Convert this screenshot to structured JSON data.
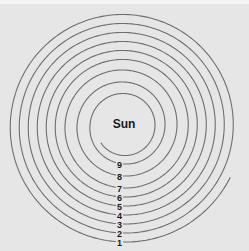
{
  "diagram": {
    "center_label": "Sun",
    "loop_labels": [
      "1",
      "2",
      "3",
      "4",
      "5",
      "6",
      "7",
      "8",
      "9"
    ],
    "colors": {
      "background": "#e6e6e6",
      "line": "#6e6e6e",
      "text": "#1a1a1a"
    }
  }
}
